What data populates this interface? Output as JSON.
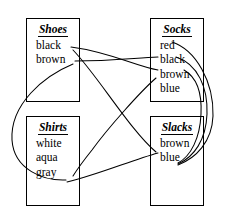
{
  "diagram": {
    "stroke_color": "#000000",
    "background_color": "#ffffff",
    "nodes": [
      {
        "id": "shoes",
        "title": "Shoes",
        "items": [
          "black",
          "brown"
        ]
      },
      {
        "id": "socks",
        "title": "Socks",
        "items": [
          "red",
          "black",
          "brown",
          "blue"
        ]
      },
      {
        "id": "shirts",
        "title": "Shirts",
        "items": [
          "white",
          "aqua",
          "gray"
        ]
      },
      {
        "id": "slacks",
        "title": "Slacks",
        "items": [
          "brown",
          "blue"
        ]
      }
    ],
    "edges": [
      {
        "from": "shoes.black",
        "to": "socks.brown"
      },
      {
        "from": "shoes.brown",
        "to": "socks.black"
      },
      {
        "from": "shoes.brown",
        "to": "shirts.gray"
      },
      {
        "from": "shoes.black",
        "to": "slacks.brown"
      },
      {
        "from": "socks.blue",
        "to": "shirts.aqua"
      },
      {
        "from": "shirts.gray",
        "to": "slacks.brown"
      },
      {
        "from": "socks.red",
        "to": "slacks.blue"
      },
      {
        "from": "socks.black",
        "to": "slacks.blue"
      },
      {
        "from": "socks.brown",
        "to": "slacks.blue"
      }
    ]
  }
}
